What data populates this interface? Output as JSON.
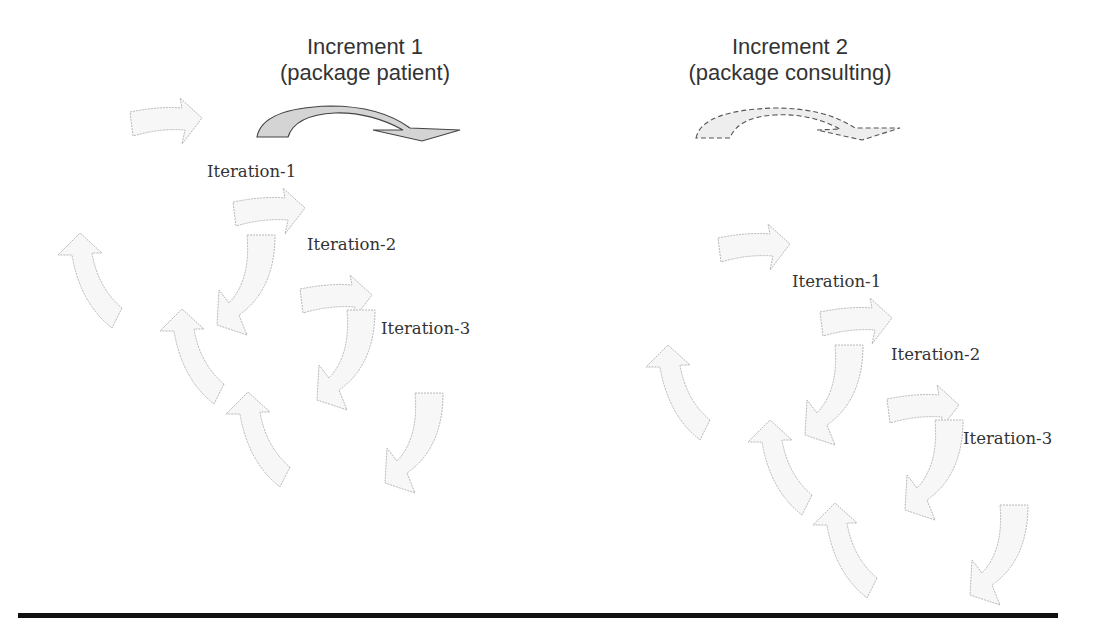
{
  "increments": [
    {
      "title_line1": "Increment 1",
      "title_line2": "(package patient)",
      "arrow_style": "solid",
      "iterations": [
        "Iteration-1",
        "Iteration-2",
        "Iteration-3"
      ]
    },
    {
      "title_line1": "Increment 2",
      "title_line2": "(package consulting)",
      "arrow_style": "dashed",
      "iterations": [
        "Iteration-1",
        "Iteration-2",
        "Iteration-3"
      ]
    }
  ],
  "colors": {
    "text": "#333333",
    "cycle_arrow_stroke": "#b8b8b8",
    "cycle_arrow_fill": "#f7f7f7",
    "increment_arrow_stroke": "#444444",
    "increment_arrow_fill": "#d4d4d4",
    "baseline": "#111111"
  }
}
